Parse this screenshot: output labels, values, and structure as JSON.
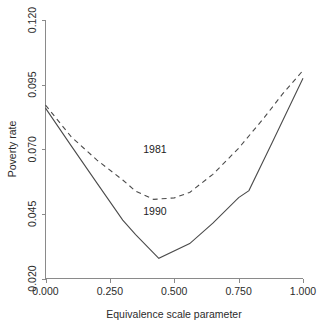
{
  "chart_data": {
    "type": "line",
    "title": "",
    "subtitle": "",
    "xlabel": "Equivalence scale parameter",
    "ylabel": "Poverty rate",
    "xlim": [
      0.0,
      1.0
    ],
    "ylim": [
      0.02,
      0.12
    ],
    "xticks": [
      0.0,
      0.25,
      0.5,
      0.75,
      1.0
    ],
    "xtick_labels": [
      "0.000",
      "0.250",
      "0.500",
      "0.750",
      "1.000"
    ],
    "yticks": [
      0.02,
      0.045,
      0.07,
      0.095,
      0.12
    ],
    "ytick_labels": [
      "0.020",
      "0.045",
      "0.070",
      "0.095",
      "0.120"
    ],
    "grid": false,
    "legend_position": "inline-annotations",
    "annotations": [
      {
        "text": "1981",
        "x": 0.425,
        "y": 0.0685
      },
      {
        "text": "1990",
        "x": 0.425,
        "y": 0.0445
      }
    ],
    "series": [
      {
        "name": "1981",
        "style": "dashed",
        "color": "#4b4b4b",
        "x": [
          0.0,
          0.1,
          0.2,
          0.3,
          0.35,
          0.42,
          0.5,
          0.56,
          0.65,
          0.75,
          0.85,
          0.92,
          1.0
        ],
        "values": [
          0.0871,
          0.0748,
          0.0658,
          0.0581,
          0.0538,
          0.0506,
          0.0512,
          0.0533,
          0.0603,
          0.0704,
          0.0823,
          0.0913,
          0.1005
        ]
      },
      {
        "name": "1990",
        "style": "solid",
        "color": "#4b4b4b",
        "x": [
          0.0,
          0.1,
          0.2,
          0.3,
          0.35,
          0.44,
          0.56,
          0.65,
          0.75,
          0.79,
          0.88,
          1.0
        ],
        "values": [
          0.0859,
          0.0713,
          0.0569,
          0.0426,
          0.037,
          0.0278,
          0.0335,
          0.0414,
          0.0513,
          0.054,
          0.0725,
          0.0975
        ]
      }
    ]
  },
  "axis": {
    "x_label": "Equivalence scale parameter",
    "y_label": "Poverty rate"
  }
}
